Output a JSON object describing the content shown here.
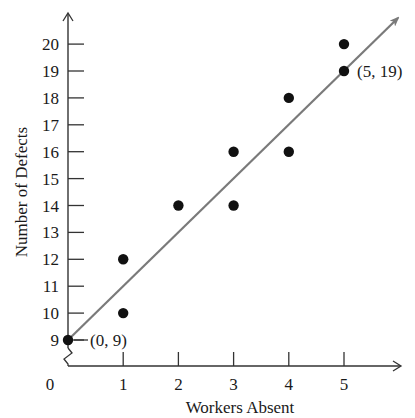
{
  "chart_data": {
    "type": "scatter",
    "title": "",
    "xlabel": "Workers Absent",
    "ylabel": "Number of Defects",
    "x_ticks": [
      1,
      2,
      3,
      4,
      5
    ],
    "y_ticks": [
      9,
      10,
      11,
      12,
      13,
      14,
      15,
      16,
      17,
      18,
      19,
      20
    ],
    "origin_label": "0",
    "y_axis_break": true,
    "grid": false,
    "legend": null,
    "series": [
      {
        "name": "Observations",
        "points": [
          {
            "x": 0,
            "y": 9
          },
          {
            "x": 1,
            "y": 10
          },
          {
            "x": 1,
            "y": 12
          },
          {
            "x": 2,
            "y": 14
          },
          {
            "x": 3,
            "y": 14
          },
          {
            "x": 3,
            "y": 16
          },
          {
            "x": 4,
            "y": 16
          },
          {
            "x": 4,
            "y": 18
          },
          {
            "x": 5,
            "y": 19
          },
          {
            "x": 5,
            "y": 20
          }
        ]
      }
    ],
    "trend_line": {
      "from": {
        "x": 0,
        "y": 9
      },
      "to": {
        "x": 5,
        "y": 19
      },
      "slope": 2,
      "intercept": 9,
      "color": "#7a7a7a"
    },
    "annotations": [
      {
        "text": "(0, 9)",
        "x": 0,
        "y": 9
      },
      {
        "text": "(5, 19)",
        "x": 5,
        "y": 19
      }
    ],
    "xlim": [
      0,
      5.8
    ],
    "ylim": [
      8,
      21
    ]
  }
}
